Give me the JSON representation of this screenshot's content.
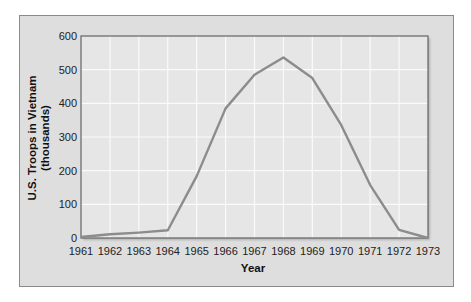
{
  "chart_data": {
    "type": "line",
    "title": "",
    "xlabel": "Year",
    "ylabel": "U.S. Troops in Vietnam",
    "ylabel_sub": "(thousands)",
    "x": [
      1961,
      1962,
      1963,
      1964,
      1965,
      1966,
      1967,
      1968,
      1969,
      1970,
      1971,
      1972,
      1973
    ],
    "series": [
      {
        "name": "U.S. Troops in Vietnam (thousands)",
        "values": [
          3,
          11,
          16,
          23,
          184,
          385,
          485,
          536,
          475,
          335,
          157,
          24,
          0
        ],
        "color": "#8c8c8c"
      }
    ],
    "xlim": [
      1961,
      1973
    ],
    "ylim": [
      0,
      600
    ],
    "yticks": [
      0,
      100,
      200,
      300,
      400,
      500,
      600
    ],
    "xticks": [
      1961,
      1962,
      1963,
      1964,
      1965,
      1966,
      1967,
      1968,
      1969,
      1970,
      1971,
      1972,
      1973
    ],
    "grid": true,
    "legend": "none"
  },
  "colors": {
    "panel_bg": "#dedede",
    "plot_bg": "#e6e6e6",
    "grid": "#fafafa",
    "axis": "#6e6e6e",
    "line": "#8c8c8c"
  }
}
